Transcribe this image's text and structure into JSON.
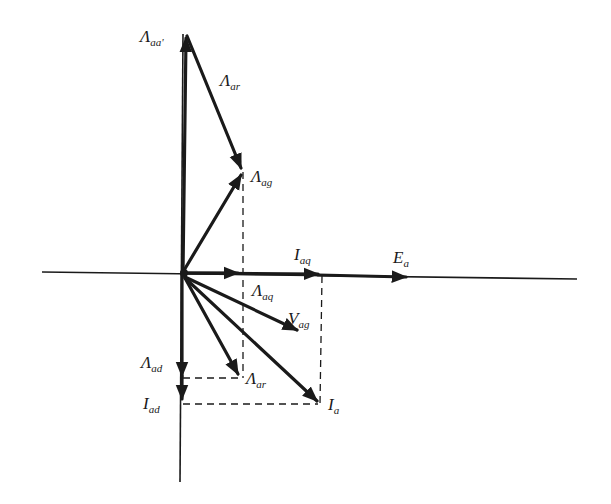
{
  "diagram": {
    "type": "phasor-diagram",
    "origin": [
      183,
      272
    ],
    "axes": {
      "horizontal": {
        "x1": 42,
        "x2": 577,
        "y": 272
      },
      "vertical": {
        "x": 183,
        "y1": 34,
        "y2": 482
      }
    },
    "phasors": [
      {
        "id": "lambda-aa",
        "symbol": "Λ",
        "sub": "aa'",
        "from": [
          183,
          272
        ],
        "to": [
          186,
          36
        ],
        "label_pos": [
          140,
          28
        ]
      },
      {
        "id": "lambda-ar-upper",
        "symbol": "Λ",
        "sub": "ar",
        "from": [
          186,
          36
        ],
        "to": [
          243,
          172
        ],
        "label_pos": [
          220,
          72
        ]
      },
      {
        "id": "lambda-ag",
        "symbol": "Λ",
        "sub": "ag",
        "from": [
          183,
          272
        ],
        "to": [
          243,
          172
        ],
        "label_pos": [
          251,
          170
        ]
      },
      {
        "id": "i-aq",
        "symbol": "I",
        "sub": "aq",
        "from": [
          183,
          272
        ],
        "to": [
          322,
          272
        ],
        "label_pos": [
          294,
          248
        ]
      },
      {
        "id": "e-a",
        "symbol": "E",
        "sub": "a",
        "from": [
          183,
          274
        ],
        "to": [
          410,
          278
        ],
        "label_pos": [
          393,
          251
        ]
      },
      {
        "id": "lambda-aq",
        "symbol": "Λ",
        "sub": "aq",
        "from": [
          183,
          272
        ],
        "to": [
          243,
          272
        ],
        "label_pos": [
          252,
          283
        ]
      },
      {
        "id": "v-ag",
        "symbol": "V",
        "sub": "ag",
        "from": [
          183,
          276
        ],
        "to": [
          300,
          331
        ],
        "label_pos": [
          289,
          313
        ]
      },
      {
        "id": "lambda-ar-lower",
        "symbol": "Λ",
        "sub": "ar",
        "from": [
          183,
          276
        ],
        "to": [
          240,
          378
        ],
        "label_pos": [
          246,
          372
        ]
      },
      {
        "id": "i-a",
        "symbol": "I",
        "sub": "a",
        "from": [
          183,
          276
        ],
        "to": [
          320,
          404
        ],
        "label_pos": [
          329,
          397
        ]
      },
      {
        "id": "lambda-ad",
        "symbol": "Λ",
        "sub": "ad",
        "from": [
          183,
          272
        ],
        "to": [
          183,
          380
        ],
        "label_pos": [
          141,
          356
        ]
      },
      {
        "id": "i-ad",
        "symbol": "I",
        "sub": "ad",
        "from": [
          183,
          380
        ],
        "to": [
          183,
          403
        ],
        "label_pos": [
          143,
          397
        ]
      }
    ],
    "dashed_lines": [
      {
        "from": [
          243,
          172
        ],
        "to": [
          243,
          378
        ]
      },
      {
        "from": [
          322,
          272
        ],
        "to": [
          322,
          404
        ]
      },
      {
        "from": [
          183,
          378
        ],
        "to": [
          240,
          378
        ]
      },
      {
        "from": [
          183,
          404
        ],
        "to": [
          320,
          404
        ]
      }
    ],
    "colors": {
      "ink": "#1a1a1a",
      "background": "#ffffff"
    }
  },
  "labels": {
    "lambda_aa": {
      "main": "Λ",
      "sub": "aa'"
    },
    "lambda_ar_upper": {
      "main": "Λ",
      "sub": "ar"
    },
    "lambda_ag": {
      "main": "Λ",
      "sub": "ag"
    },
    "i_aq": {
      "main": "I",
      "sub": "aq"
    },
    "e_a": {
      "main": "E",
      "sub": "a"
    },
    "lambda_aq": {
      "main": "Λ",
      "sub": "aq"
    },
    "v_ag": {
      "main": "V",
      "sub": "ag"
    },
    "lambda_ar_lower": {
      "main": "Λ",
      "sub": "ar"
    },
    "i_a": {
      "main": "I",
      "sub": "a"
    },
    "lambda_ad": {
      "main": "Λ",
      "sub": "ad"
    },
    "i_ad": {
      "main": "I",
      "sub": "ad"
    }
  }
}
